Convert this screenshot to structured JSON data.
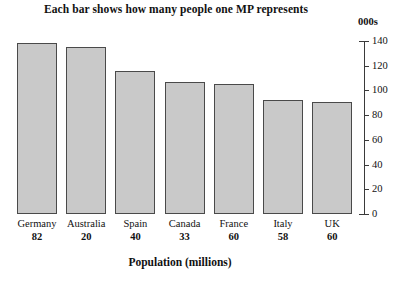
{
  "chart_data": {
    "type": "bar",
    "title": "Each bar shows how many people one MP represents",
    "xlabel": "Population (millions)",
    "ylabel": "000s",
    "units_label": "000s",
    "categories": [
      "Germany",
      "Australia",
      "Spain",
      "Canada",
      "France",
      "Italy",
      "UK"
    ],
    "values": [
      138,
      135,
      116,
      107,
      105,
      92,
      91
    ],
    "category_sublabels": [
      "82",
      "20",
      "40",
      "33",
      "60",
      "58",
      "60"
    ],
    "ylim": [
      0,
      140
    ],
    "ytick_labels": [
      "140",
      "120",
      "100",
      "80",
      "60",
      "40",
      "20",
      "0"
    ],
    "yticks": [
      140,
      120,
      100,
      80,
      60,
      40,
      20,
      0
    ],
    "axis_position": "right",
    "grid": false,
    "legend": false,
    "bar_fill_color": "#c9c9c9",
    "bar_edge_color": "#4a4a4a",
    "background_color": "#ffffff"
  }
}
